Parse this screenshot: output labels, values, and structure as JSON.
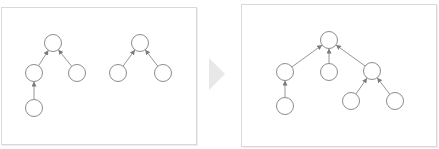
{
  "diagram": {
    "type": "forest-merge",
    "colors": {
      "node_stroke": "#8c8c8c",
      "edge": "#8a8a8a",
      "transition_arrow": "#e8e8e8",
      "panel_border": "#d9d9d9"
    },
    "node_radius": 8.5,
    "left_panel": {
      "box": {
        "x": 1,
        "y": 7,
        "w": 194,
        "h": 136
      },
      "nodes": [
        {
          "id": "a",
          "x": 53,
          "y": 43
        },
        {
          "id": "b",
          "x": 34,
          "y": 73
        },
        {
          "id": "c",
          "x": 77,
          "y": 73
        },
        {
          "id": "d",
          "x": 34,
          "y": 108
        },
        {
          "id": "e",
          "x": 140,
          "y": 43
        },
        {
          "id": "f",
          "x": 118,
          "y": 73
        },
        {
          "id": "g",
          "x": 163,
          "y": 73
        }
      ],
      "edges": [
        {
          "from": "b",
          "to": "a"
        },
        {
          "from": "c",
          "to": "a"
        },
        {
          "from": "d",
          "to": "b"
        },
        {
          "from": "f",
          "to": "e"
        },
        {
          "from": "g",
          "to": "e"
        }
      ]
    },
    "transition": {
      "shape": "right-triangle",
      "points": [
        [
          209,
          58
        ],
        [
          225,
          74
        ],
        [
          209,
          90
        ]
      ]
    },
    "right_panel": {
      "box": {
        "x": 241,
        "y": 4,
        "w": 194,
        "h": 141
      },
      "nodes": [
        {
          "id": "r",
          "x": 329,
          "y": 40
        },
        {
          "id": "b",
          "x": 285,
          "y": 72
        },
        {
          "id": "m",
          "x": 329,
          "y": 72
        },
        {
          "id": "e",
          "x": 372,
          "y": 71
        },
        {
          "id": "d",
          "x": 285,
          "y": 106
        },
        {
          "id": "f",
          "x": 351,
          "y": 101
        },
        {
          "id": "g",
          "x": 395,
          "y": 101
        }
      ],
      "edges": [
        {
          "from": "b",
          "to": "r"
        },
        {
          "from": "m",
          "to": "r"
        },
        {
          "from": "e",
          "to": "r"
        },
        {
          "from": "d",
          "to": "b"
        },
        {
          "from": "f",
          "to": "e"
        },
        {
          "from": "g",
          "to": "e"
        }
      ]
    }
  }
}
